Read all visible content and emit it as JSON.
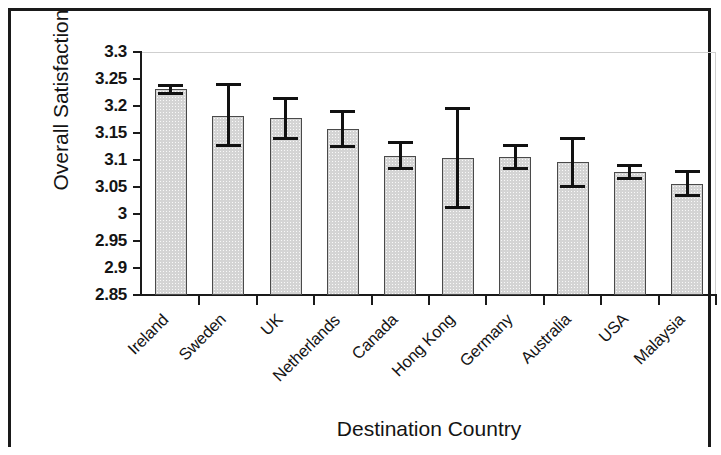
{
  "chart_data": {
    "type": "bar",
    "title": "",
    "xlabel": "Destination Country",
    "ylabel": "Overall Satisfaction",
    "ylim": [
      2.85,
      3.3
    ],
    "ytick_labels": [
      "3.3",
      "3.25",
      "3.2",
      "3.15",
      "3.1",
      "3.05",
      "3",
      "2.95",
      "2.9",
      "2.85"
    ],
    "ytick_values": [
      3.3,
      3.25,
      3.2,
      3.15,
      3.1,
      3.05,
      3.0,
      2.95,
      2.9,
      2.85
    ],
    "grid": false,
    "legend": null,
    "categories": [
      "Ireland",
      "Sweden",
      "UK",
      "Netherlands",
      "Canada",
      "Hong Kong",
      "Germany",
      "Australia",
      "USA",
      "Malaysia"
    ],
    "values": [
      3.231,
      3.182,
      3.178,
      3.157,
      3.108,
      3.104,
      3.105,
      3.096,
      3.077,
      3.056
    ],
    "error_low": [
      3.224,
      3.126,
      3.139,
      3.125,
      3.085,
      3.012,
      3.085,
      3.051,
      3.066,
      3.034
    ],
    "error_high": [
      3.238,
      3.24,
      3.213,
      3.19,
      3.132,
      3.196,
      3.126,
      3.14,
      3.089,
      3.079
    ],
    "bar_fill_color": "#d4d4d4",
    "bar_edge_color": "#4a4a4a",
    "error_bar_color": "#111111",
    "axis_color": "#1a1a1a"
  }
}
